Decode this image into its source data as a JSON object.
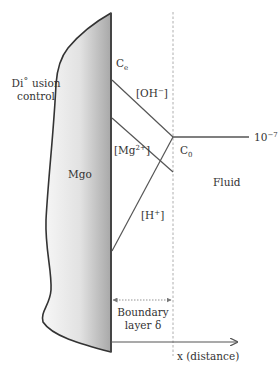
{
  "diagram": {
    "colors": {
      "line": "#555555",
      "outline": "#333333",
      "dash": "#9a9a9a",
      "solid_light": "#f5f5f5",
      "solid_dark": "#a9a9a9",
      "text": "#333333"
    },
    "labels": {
      "diffusion_line1": "Di˚ usion",
      "diffusion_line2": "control",
      "solid": "Mgo",
      "ce_main": "C",
      "ce_sub": "e",
      "oh_label": "[OH",
      "oh_sup": "−",
      "oh_close": "]",
      "mg_label": "[Mg",
      "mg_sup": "2+",
      "mg_close": "]",
      "h_label": "[H",
      "h_sup": "+",
      "h_close": "]",
      "c0_main": "C",
      "c0_sub": "0",
      "ten_base": "10",
      "ten_exp": "−7",
      "fluid": "Fluid",
      "boundary_line1": "Boundary",
      "boundary_line2": "layer δ",
      "x_axis": "x (distance)"
    },
    "geometry": {
      "solid_surface_x": 111,
      "boundary_x": 173,
      "c0_point": [
        173,
        137
      ],
      "bulk_line_end_x": 249,
      "oh_line": [
        [
          111,
          80
        ],
        [
          173,
          137
        ]
      ],
      "mg_line": [
        [
          111,
          118
        ],
        [
          173,
          172
        ]
      ],
      "h_line": [
        [
          111,
          251
        ],
        [
          173,
          137
        ]
      ],
      "boundary_arrow_y": 300,
      "x_axis_y": 342,
      "x_axis_end_x": 238
    }
  }
}
